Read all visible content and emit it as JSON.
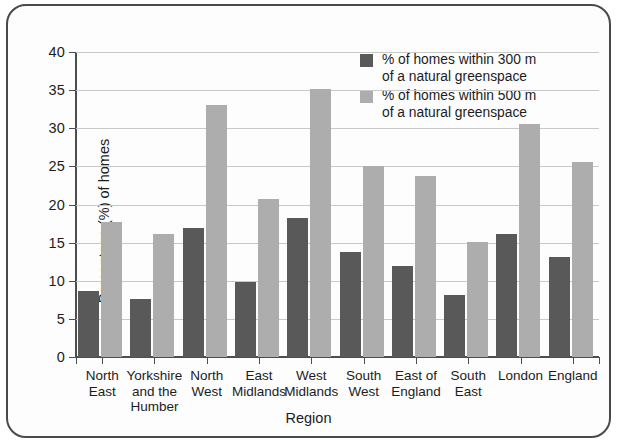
{
  "chart_data": {
    "type": "bar",
    "title": "",
    "xlabel": "Region",
    "ylabel": "Percentage (%) of homes",
    "ylim": [
      0,
      40
    ],
    "ytick_step": 5,
    "yticks": [
      "0",
      "5",
      "10",
      "15",
      "20",
      "25",
      "30",
      "35",
      "40"
    ],
    "grid": true,
    "legend_position": "top-right-inside",
    "categories": [
      "North\nEast",
      "Yorkshire\nand the\nHumber",
      "North\nWest",
      "East\nMidlands",
      "West\nMidlands",
      "South\nWest",
      "East of\nEngland",
      "South\nEast",
      "London",
      "England"
    ],
    "series": [
      {
        "name": "% of homes within 300 m of a natural greenspace",
        "legend_line1": "% of homes within 300 m",
        "legend_line2": "of a natural greenspace",
        "color": "#59595a",
        "values": [
          8.6,
          7.6,
          16.9,
          9.9,
          18.2,
          13.8,
          11.9,
          8.1,
          16.1,
          13.1
        ]
      },
      {
        "name": "% of homes within 500 m of a natural greenspace",
        "legend_line1": "% of homes within 500 m",
        "legend_line2": "of a natural greenspace",
        "color": "#adadad",
        "values": [
          17.7,
          16.1,
          33.1,
          20.7,
          35.2,
          25.1,
          23.7,
          15.1,
          30.6,
          25.6
        ]
      }
    ]
  },
  "colors": {
    "series_300m": "#59595a",
    "series_500m": "#adadad",
    "axis": "#4d4d4d",
    "grid": "#c9c9c9",
    "border": "#4a4a4a",
    "text": "#1c1c1c"
  }
}
